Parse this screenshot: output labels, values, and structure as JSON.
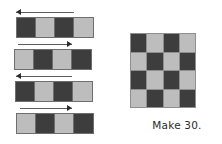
{
  "canvas": {
    "width": 222,
    "height": 144,
    "background": "#ffffff"
  },
  "palette": {
    "dark_cell": "#3d3d3d",
    "light_cell": "#bdbdbd",
    "grid_line": "#8f8f8f",
    "strip_border": "#6e6e6e",
    "arrow": "#2f2f2f",
    "text": "#2b2b2b"
  },
  "strips": {
    "count": 4,
    "cells_per_strip": 4,
    "items": [
      {
        "index": 1,
        "arrow_direction": "left",
        "arrow_icon": "arrow-left-icon",
        "left": 16,
        "top": 8,
        "arrow_left": 16,
        "arrow_width": 58,
        "pattern": [
          "dark",
          "light",
          "dark",
          "light"
        ]
      },
      {
        "index": 2,
        "arrow_direction": "right",
        "arrow_icon": "arrow-right-icon",
        "left": 14,
        "top": 40,
        "arrow_left": 18,
        "arrow_width": 54,
        "pattern": [
          "light",
          "dark",
          "light",
          "dark"
        ]
      },
      {
        "index": 3,
        "arrow_direction": "left",
        "arrow_icon": "arrow-left-icon",
        "left": 15,
        "top": 72,
        "arrow_left": 16,
        "arrow_width": 56,
        "pattern": [
          "dark",
          "light",
          "dark",
          "light"
        ]
      },
      {
        "index": 4,
        "arrow_direction": "right",
        "arrow_icon": "arrow-right-icon",
        "left": 16,
        "top": 104,
        "arrow_left": 20,
        "arrow_width": 52,
        "pattern": [
          "light",
          "dark",
          "light",
          "dark"
        ]
      }
    ]
  },
  "board": {
    "rows": 4,
    "columns": 4,
    "pattern": [
      [
        "dark",
        "light",
        "dark",
        "light"
      ],
      [
        "light",
        "dark",
        "light",
        "dark"
      ],
      [
        "dark",
        "light",
        "dark",
        "light"
      ],
      [
        "light",
        "dark",
        "light",
        "dark"
      ]
    ],
    "caption": "Make 30."
  }
}
